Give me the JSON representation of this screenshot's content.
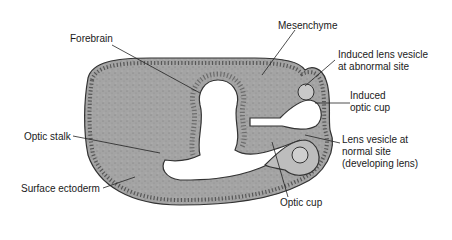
{
  "diagram": {
    "colors": {
      "tissue_fill": "#a8a8a8",
      "epithelium": "#c8c8c8",
      "outline": "#333333",
      "background": "#ffffff"
    },
    "labels": {
      "forebrain": "Forebrain",
      "mesenchyme": "Mesenchyme",
      "induced_lens_line1": "Induced lens vesicle",
      "induced_lens_line2": "at abnormal site",
      "induced_cup_line1": "Induced",
      "induced_cup_line2": "optic cup",
      "lens_normal_line1": "Lens vesicle at",
      "lens_normal_line2": "normal site",
      "lens_normal_line3": "(developing lens)",
      "optic_stalk": "Optic stalk",
      "surface_ectoderm": "Surface ectoderm",
      "optic_cup": "Optic cup"
    }
  }
}
